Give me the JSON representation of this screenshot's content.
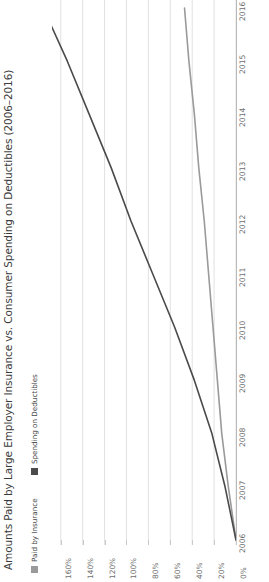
{
  "chart": {
    "title": "Amounts Paid by Large Employer Insurance vs. Consumer Spending on Deductibles (2006–2016)",
    "legend": [
      {
        "label": "Paid by Insurance",
        "color": "#9a9a9a"
      },
      {
        "label": "Spending on Deductibles",
        "color": "#4a4a4a"
      }
    ]
  },
  "chart_data": {
    "type": "line",
    "title": "Amounts Paid by Large Employer Insurance vs. Consumer Spending on Deductibles (2006–2016)",
    "orientation": "rotated-90-ccw",
    "xlabel": "",
    "ylabel": "",
    "x": [
      2006,
      2007,
      2008,
      2009,
      2010,
      2011,
      2012,
      2013,
      2014,
      2015,
      2016
    ],
    "categories": [
      "2006",
      "2007",
      "2008",
      "2009",
      "2010",
      "2011",
      "2012",
      "2013",
      "2014",
      "2015",
      "2016"
    ],
    "value_tick_labels": [
      "160%",
      "140%",
      "120%",
      "100%",
      "80%",
      "60%",
      "40%",
      "20%",
      "0%"
    ],
    "value_ticks": [
      160,
      140,
      120,
      100,
      80,
      60,
      40,
      20,
      0
    ],
    "value_axis_direction": "increases-leftward",
    "ylim": [
      0,
      176
    ],
    "grid": true,
    "legend_position": "left-rotated",
    "series": [
      {
        "name": "Paid by Insurance",
        "color": "#9a9a9a",
        "values": [
          0,
          7,
          13,
          17,
          21,
          25,
          29,
          34,
          38,
          43,
          47
        ]
      },
      {
        "name": "Spending on Deductibles",
        "color": "#4a4a4a",
        "values": [
          0,
          10,
          22,
          38,
          56,
          76,
          96,
          114,
          134,
          154,
          176
        ]
      }
    ]
  }
}
